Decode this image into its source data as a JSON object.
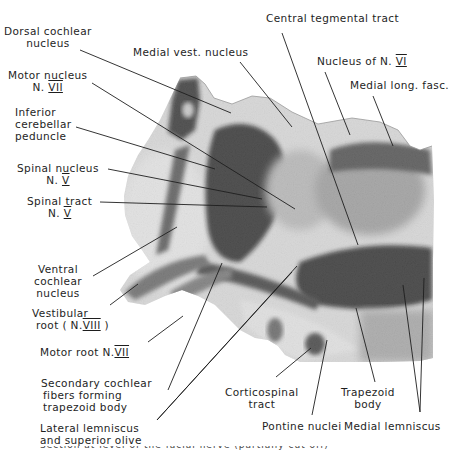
{
  "figure": {
    "type": "labeled histological section (brainstem, pons level)",
    "caption_partial": "Section at level of the facial nerve (partially cut off)"
  },
  "labels": {
    "dorsal_cochlear": {
      "line1": "Dorsal cochlear",
      "line2": "nucleus"
    },
    "medial_vest": {
      "line1": "Medial vest. nucleus"
    },
    "central_tegmental": {
      "line1": "Central tegmental tract"
    },
    "nucleus_vi": {
      "line1": "Nucleus of N.",
      "numeral": "VI"
    },
    "medial_long_fasc": {
      "line1": "Medial long. fasc."
    },
    "motor_nucleus_vii": {
      "line1": "Motor nucleus",
      "line2_prefix": "N.",
      "numeral": "VII"
    },
    "inferior_cerebellar": {
      "line1": "Inferior",
      "line2": "cerebellar",
      "line3": "peduncle"
    },
    "spinal_nucleus_v": {
      "line1": "Spinal nucleus",
      "line2_prefix": "N.",
      "numeral": "V"
    },
    "spinal_tract_v": {
      "line1": "Spinal tract",
      "line2_prefix": "N.",
      "numeral": "V"
    },
    "ventral_cochlear": {
      "line1": "Ventral",
      "line2": "cochlear",
      "line3": "nucleus"
    },
    "vestibular_root": {
      "line1": "Vestibular",
      "line2_prefix": "root ( N.",
      "numeral": "VIII",
      "line2_suffix": ")"
    },
    "motor_root_vii": {
      "line1_prefix": "Motor root N.",
      "numeral": "VII"
    },
    "secondary_cochlear": {
      "line1": "Secondary cochlear",
      "line2": "fibers forming",
      "line3": "trapezoid body"
    },
    "lateral_lemniscus": {
      "line1": "Lateral lemniscus",
      "line2": "and superior olive"
    },
    "corticospinal": {
      "line1": "Corticospinal",
      "line2": "tract"
    },
    "pontine_nuclei": {
      "line1": "Pontine nuclei"
    },
    "trapezoid_body": {
      "line1": "Trapezoid",
      "line2": "body"
    },
    "medial_lemniscus": {
      "line1": "Medial lemniscus"
    }
  },
  "colors": {
    "ink": "#1e1e1e",
    "tissue_light": "#e6e6e6",
    "tissue_dark": "#141414",
    "background": "#ffffff"
  }
}
